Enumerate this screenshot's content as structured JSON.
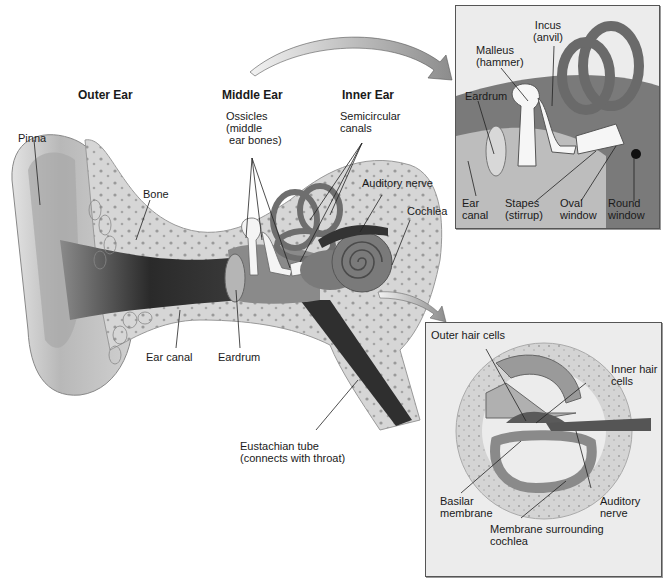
{
  "figure": {
    "sections": {
      "outer_ear": "Outer Ear",
      "middle_ear": "Middle Ear",
      "inner_ear": "Inner Ear"
    },
    "main_labels": {
      "pinna": "Pinna",
      "bone": "Bone",
      "ossicles": "Ossicles\n(middle\n ear bones)",
      "semicircular_canals": "Semicircular\ncanals",
      "auditory_nerve": "Auditory nerve",
      "cochlea": "Cochlea",
      "ear_canal": "Ear canal",
      "eardrum": "Eardrum",
      "eustachian_tube": "Eustachian tube\n(connects with throat)"
    },
    "middle_ear_inset": {
      "incus": "Incus\n(anvil)",
      "malleus": "Malleus\n(hammer)",
      "eardrum": "Eardrum",
      "ear_canal": "Ear\ncanal",
      "stapes": "Stapes\n(stirrup)",
      "oval_window": "Oval\nwindow",
      "round_window": "Round\nwindow"
    },
    "cochlea_inset": {
      "outer_hair_cells": "Outer hair cells",
      "inner_hair_cells": "Inner hair\ncells",
      "basilar_membrane": "Basilar\nmembrane",
      "auditory_nerve": "Auditory\nnerve",
      "membrane_surrounding_cochlea": "Membrane surrounding\ncochlea"
    },
    "colors": {
      "bone": "#d9d9d9",
      "bone_dots": "#9a9a9a",
      "canal_dark": "#2a2a2a",
      "canal_mid": "#6e6e6e",
      "inner_ear": "#7a7a7a",
      "ossicle": "#f4f4f4",
      "inset_bg": "#ececec"
    }
  }
}
